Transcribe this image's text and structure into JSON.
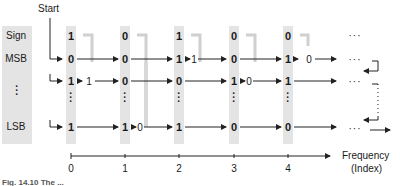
{
  "diagram": {
    "start_label": "Start",
    "row_labels": [
      "Sign",
      "MSB",
      "⋮",
      "LSB"
    ],
    "columns": [
      {
        "index": "0",
        "sign": "1",
        "msb": "0",
        "row2": "1",
        "lsb": "1"
      },
      {
        "index": "1",
        "sign": "0",
        "msb": "0",
        "row2": "0",
        "lsb": "1"
      },
      {
        "index": "2",
        "sign": "1",
        "msb": "1",
        "row2": "0",
        "lsb": "1"
      },
      {
        "index": "3",
        "sign": "0",
        "msb": "0",
        "row2": "1",
        "lsb": "0"
      },
      {
        "index": "4",
        "sign": "0",
        "msb": "1",
        "row2": "1",
        "lsb": "0"
      }
    ],
    "run_lengths": {
      "msb_after_2": "1",
      "msb_after_4": "0",
      "row2_after_0": "1",
      "row2_after_3": "0",
      "lsb_after_1": "0"
    },
    "ellipsis": "···",
    "axis_label_line1": "Frequency",
    "axis_label_line2": "(Index)",
    "caption": "Fig. 14.10 The ..."
  }
}
